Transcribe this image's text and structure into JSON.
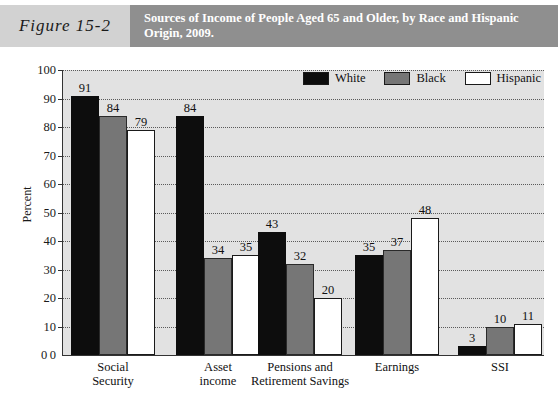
{
  "figure": {
    "number_label": "Figure 15-2",
    "title": "Sources of Income of People Aged 65 and Older, by Race and Hispanic Origin, 2009."
  },
  "colors": {
    "figure_number_band": "#d2d2d2",
    "title_band": "#8f8f8f",
    "title_text": "#ffffff",
    "plot_background": "#e2e2e2",
    "series_white": "#0d0d0d",
    "series_black": "#767676",
    "series_hispanic": "#ffffff",
    "axis": "#333333",
    "gridline": "#5a5a5a"
  },
  "legend": {
    "position": "top-right",
    "entries": [
      {
        "label": "White",
        "swatch": "#0d0d0d"
      },
      {
        "label": "Black",
        "swatch": "#767676"
      },
      {
        "label": "Hispanic",
        "swatch": "#ffffff"
      }
    ]
  },
  "axes": {
    "y_title": "Percent",
    "y_ticks": [
      0,
      10,
      20,
      30,
      40,
      50,
      60,
      70,
      80,
      90,
      100
    ],
    "y_zero_label": "0"
  },
  "chart_data": {
    "type": "bar",
    "title": "Sources of Income of People Aged 65 and Older, by Race and Hispanic Origin, 2009.",
    "xlabel": "",
    "ylabel": "Percent",
    "ylim": [
      0,
      100
    ],
    "ytick_step": 10,
    "grid": true,
    "legend_position": "top-right",
    "categories": [
      "Social Security",
      "Asset income",
      "Pensions and Retirement Savings",
      "Earnings",
      "SSI"
    ],
    "category_lines": [
      [
        "Social",
        "Security"
      ],
      [
        "Asset",
        "income"
      ],
      [
        "Pensions and",
        "Retirement Savings"
      ],
      [
        "Earnings"
      ],
      [
        "SSI"
      ]
    ],
    "series": [
      {
        "name": "White",
        "color": "#0d0d0d",
        "values": [
          91,
          84,
          43,
          35,
          3
        ]
      },
      {
        "name": "Black",
        "color": "#767676",
        "values": [
          84,
          34,
          32,
          37,
          10
        ]
      },
      {
        "name": "Hispanic",
        "color": "#ffffff",
        "values": [
          79,
          35,
          20,
          48,
          11
        ]
      }
    ]
  }
}
